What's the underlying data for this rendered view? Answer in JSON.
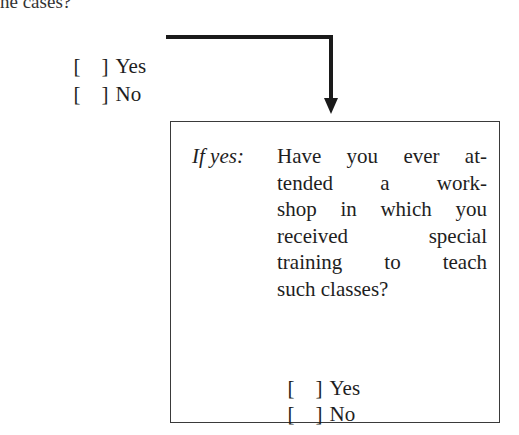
{
  "top_fragment": "ne cases?",
  "main_question": {
    "options": [
      {
        "bracket": "[    ]",
        "label": "Yes"
      },
      {
        "bracket": "[    ]",
        "label": "No"
      }
    ]
  },
  "followup": {
    "condition_label": "If yes:",
    "question_lines": [
      "Have you ever at-",
      "tended a work-",
      "shop in which you",
      "received special",
      "training to teach",
      "such classes?"
    ],
    "options": [
      {
        "bracket": "[    ]",
        "label": "Yes"
      },
      {
        "bracket": "[    ]",
        "label": "No"
      }
    ]
  },
  "colors": {
    "text": "#1e1e1e",
    "arrow": "#1a1a1a",
    "border": "#3a3a3a"
  }
}
